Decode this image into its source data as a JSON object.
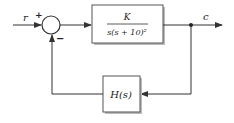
{
  "diagram": {
    "type": "feedback-control-block-diagram",
    "input": {
      "label": "r"
    },
    "summing_junction": {
      "plus_sign": "+",
      "minus_sign": "−"
    },
    "forward_block": {
      "numerator": "K",
      "denominator": "s(s + 10)²"
    },
    "output": {
      "label": "c"
    },
    "feedback_block": {
      "label": "H(s)"
    }
  },
  "colors": {
    "line": "#333333",
    "block_border": "#555555",
    "block_shadow": "#bbbbbb",
    "text": "#222222"
  }
}
